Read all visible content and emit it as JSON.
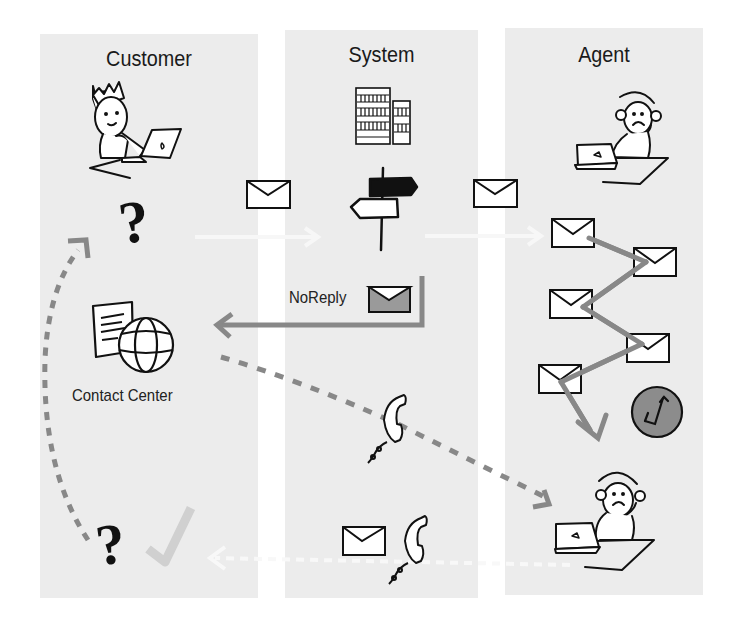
{
  "diagram": {
    "columns": [
      {
        "id": "customer",
        "title": "Customer"
      },
      {
        "id": "system",
        "title": "System"
      },
      {
        "id": "agent",
        "title": "Agent"
      }
    ],
    "labels": {
      "contact_center": "Contact Center",
      "noreply": "NoReply"
    },
    "icons": [
      "customer-king-laptop-icon",
      "question-mark-icon",
      "server-buildings-icon",
      "signpost-icon",
      "envelope-icon",
      "noreply-envelope-icon",
      "contact-center-document-globe-icon",
      "telephone-handset-icon",
      "agent-headset-laptop-icon",
      "clock-icon",
      "checkmark-icon"
    ],
    "colors": {
      "panel_bg": "#ececec",
      "arrow_gray": "#8a8a8a",
      "faint_arrow": "#f6f6f6",
      "clock_fill": "#8c8c8c",
      "noreply_fill": "#9a9a9a",
      "check_gray": "#cfcfcf",
      "ink": "#111111"
    }
  }
}
